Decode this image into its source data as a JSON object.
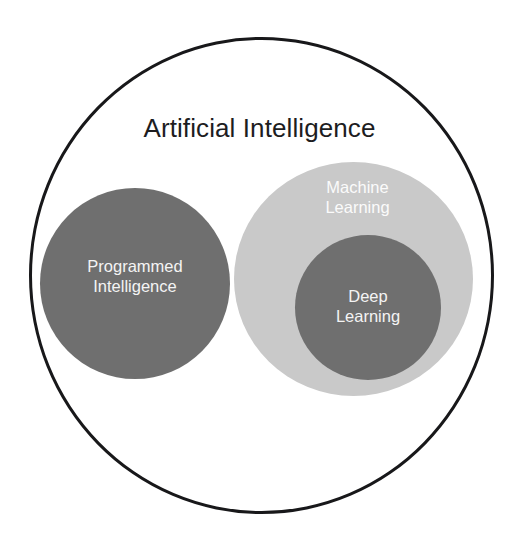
{
  "diagram": {
    "type": "nested-venn",
    "background_color": "#ffffff",
    "outer": {
      "name": "Artificial Intelligence",
      "label": "Artificial Intelligence",
      "fill_color": "#ffffff",
      "stroke_color": "#18181a",
      "text_color": "#1d1d1f"
    },
    "sets": [
      {
        "key": "programmed_intelligence",
        "label": "Programmed\nIntelligence",
        "fill_color": "#6f6f6f",
        "text_color": "#f4f4f4",
        "parent": "Artificial Intelligence"
      },
      {
        "key": "machine_learning",
        "label": "Machine\nLearning",
        "fill_color": "#c9c9c9",
        "text_color": "#fbfbfb",
        "parent": "Artificial Intelligence"
      },
      {
        "key": "deep_learning",
        "label": "Deep\nLearning",
        "fill_color": "#6f6f6f",
        "text_color": "#f4f4f4",
        "parent": "Machine Learning"
      }
    ]
  }
}
